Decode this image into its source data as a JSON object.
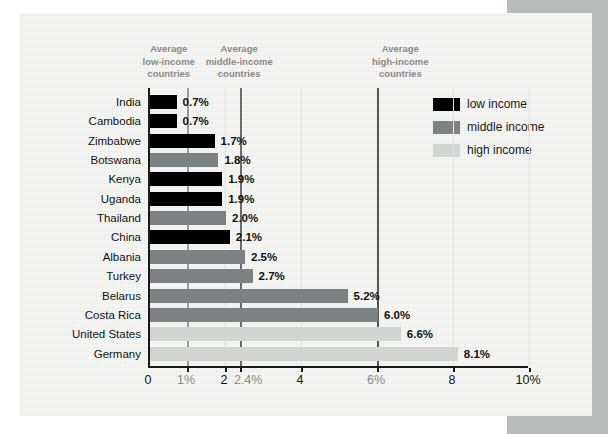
{
  "colors": {
    "background": "#ffffff",
    "side_block": "#b7bbb9",
    "panel": "#f4f5f2",
    "axis": "#1a1a1a",
    "low": "#000000",
    "middle": "#7c8283",
    "high": "#d2d5d1",
    "gridline": "#e3e4e1",
    "ref_line_low": "#9c9c9c",
    "ref_line_middle": "#6b6b6b",
    "ref_line_high": "#54585a",
    "muted_text": "#8a8a8a",
    "label_text": "#111111"
  },
  "chart_data": {
    "type": "bar",
    "orientation": "horizontal",
    "title": "",
    "xlabel": "",
    "ylabel": "",
    "xlim": [
      0,
      10
    ],
    "grid": "vertical-subtle",
    "legend_position": "top-right",
    "categories": [
      "India",
      "Cambodia",
      "Zimbabwe",
      "Botswana",
      "Kenya",
      "Uganda",
      "Thailand",
      "China",
      "Albania",
      "Turkey",
      "Belarus",
      "Costa Rica",
      "United States",
      "Germany"
    ],
    "values": [
      0.7,
      0.7,
      1.7,
      1.8,
      1.9,
      1.9,
      2.0,
      2.1,
      2.5,
      2.7,
      5.2,
      6.0,
      6.6,
      8.1
    ],
    "value_labels": [
      "0.7%",
      "0.7%",
      "1.7%",
      "1.8%",
      "1.9%",
      "1.9%",
      "2.0%",
      "2.1%",
      "2.5%",
      "2.7%",
      "5.2%",
      "6.0%",
      "6.6%",
      "8.1%"
    ],
    "groups": [
      "low",
      "low",
      "low",
      "middle",
      "low",
      "low",
      "middle",
      "low",
      "middle",
      "middle",
      "middle",
      "middle",
      "high",
      "high"
    ],
    "x_ticks": [
      {
        "value": 0,
        "label": "0",
        "muted": false
      },
      {
        "value": 1,
        "label": "1%",
        "muted": true
      },
      {
        "value": 2,
        "label": "2",
        "muted": false
      },
      {
        "value": 2.4,
        "label": "2.4%",
        "muted": true
      },
      {
        "value": 4,
        "label": "4",
        "muted": false
      },
      {
        "value": 6,
        "label": "6%",
        "muted": true
      },
      {
        "value": 8,
        "label": "8",
        "muted": false
      },
      {
        "value": 10,
        "label": "10%",
        "muted": false
      }
    ],
    "gridlines": [
      2,
      4,
      8,
      10
    ],
    "reference_lines": [
      {
        "value": 1,
        "group": "low",
        "label_lines": [
          "Average",
          "low-income",
          "countries"
        ],
        "align": "right"
      },
      {
        "value": 2.4,
        "group": "middle",
        "label_lines": [
          "Average",
          "middle-income",
          "countries"
        ],
        "align": "center"
      },
      {
        "value": 6,
        "group": "high",
        "label_lines": [
          "Average",
          "high-income",
          "countries"
        ],
        "align": "left"
      }
    ],
    "legend": [
      {
        "label": "low income",
        "group": "low"
      },
      {
        "label": "middle income",
        "group": "middle"
      },
      {
        "label": "high income",
        "group": "high"
      }
    ]
  }
}
